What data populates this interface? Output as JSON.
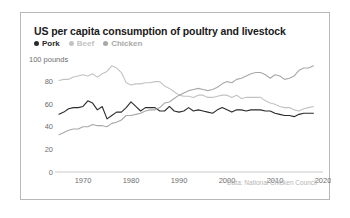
{
  "card": {
    "title": "US per capita consumption of poultry and livestock",
    "source": "Data: National Chicken Council"
  },
  "legend": {
    "position": "top-left",
    "items": [
      {
        "label": "Pork",
        "color": "#2b2b2b",
        "marker": "legend-dot-icon"
      },
      {
        "label": "Beef",
        "color": "#c2c2c2",
        "marker": "legend-dot-icon"
      },
      {
        "label": "Chicken",
        "color": "#a8a8a8",
        "marker": "legend-dot-icon"
      }
    ]
  },
  "axis": {
    "y_unit_label": "100 pounds",
    "y_ticks": [
      "100 pounds",
      "80",
      "60",
      "40",
      "20",
      "0"
    ],
    "x_ticks": [
      "1970",
      "1980",
      "1990",
      "2000",
      "2010",
      "2020"
    ]
  },
  "chart_data": {
    "type": "line",
    "title": "US per capita consumption of poultry and livestock",
    "subtitle": "",
    "xlabel": "",
    "ylabel": "100 pounds",
    "xlim": [
      1965,
      2020
    ],
    "ylim": [
      0,
      100
    ],
    "grid": false,
    "legend_position": "top-left",
    "annotations": [
      "Data: National Chicken Council"
    ],
    "x": [
      1965,
      1966,
      1967,
      1968,
      1969,
      1970,
      1971,
      1972,
      1973,
      1974,
      1975,
      1976,
      1977,
      1978,
      1979,
      1980,
      1981,
      1982,
      1983,
      1984,
      1985,
      1986,
      1987,
      1988,
      1989,
      1990,
      1991,
      1992,
      1993,
      1994,
      1995,
      1996,
      1997,
      1998,
      1999,
      2000,
      2001,
      2002,
      2003,
      2004,
      2005,
      2006,
      2007,
      2008,
      2009,
      2010,
      2011,
      2012,
      2013,
      2014,
      2015,
      2016,
      2017,
      2018
    ],
    "series": [
      {
        "name": "Pork",
        "color": "#2b2b2b",
        "values": [
          51,
          53,
          56,
          57,
          57,
          58,
          63,
          61,
          55,
          58,
          47,
          50,
          53,
          53,
          57,
          62,
          58,
          54,
          57,
          57,
          57,
          54,
          54,
          58,
          54,
          53,
          54,
          57,
          54,
          55,
          54,
          53,
          52,
          55,
          57,
          55,
          53,
          55,
          55,
          54,
          55,
          55,
          55,
          54,
          54,
          52,
          51,
          50,
          50,
          49,
          51,
          52,
          52,
          52
        ]
      },
      {
        "name": "Beef",
        "color": "#c2c2c2",
        "values": [
          81,
          82,
          82,
          84,
          85,
          86,
          85,
          87,
          84,
          87,
          89,
          94,
          92,
          88,
          79,
          77,
          78,
          78,
          79,
          79,
          80,
          80,
          76,
          74,
          71,
          68,
          67,
          67,
          66,
          68,
          68,
          66,
          66,
          67,
          68,
          68,
          66,
          68,
          65,
          66,
          66,
          66,
          66,
          63,
          61,
          60,
          58,
          57,
          57,
          55,
          54,
          56,
          57,
          58
        ]
      },
      {
        "name": "Chicken",
        "color": "#a8a8a8",
        "values": [
          33,
          35,
          37,
          38,
          38,
          40,
          40,
          42,
          41,
          41,
          40,
          43,
          44,
          46,
          50,
          50,
          51,
          52,
          54,
          55,
          55,
          57,
          61,
          62,
          65,
          68,
          70,
          72,
          73,
          74,
          73,
          72,
          73,
          75,
          78,
          80,
          79,
          82,
          83,
          85,
          87,
          88,
          88,
          86,
          83,
          86,
          85,
          82,
          83,
          85,
          90,
          92,
          92,
          94
        ]
      }
    ]
  }
}
